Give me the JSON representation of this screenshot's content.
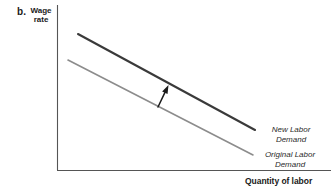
{
  "figure": {
    "panel_letter": "b.",
    "background_color": "#ffffff"
  },
  "axes": {
    "y_axis_title_line1": "Wage",
    "y_axis_title_line2": "rate",
    "x_axis_title": "Quantity of labor",
    "axis_color": "#555555"
  },
  "chart_data": {
    "type": "line",
    "title": "",
    "subtitle": "",
    "xlabel": "Quantity of labor",
    "ylabel": "Wage rate",
    "xlim": [
      0,
      100
    ],
    "ylim": [
      0,
      100
    ],
    "grid": false,
    "legend_position": "inline-right-of-curve",
    "axis_ticks": [],
    "tick_labels": [],
    "series": [
      {
        "name": "New Labor Demand",
        "label_line1": "New Labor",
        "label_line2": "Demand",
        "color": "#3a3a3a",
        "width": 2.1,
        "style": "solid",
        "x": [
          7.7,
          72.2
        ],
        "y": [
          82.4,
          24.2
        ],
        "x_pixels": [
          78,
          255
        ],
        "y_pixels": [
          34,
          130
        ]
      },
      {
        "name": "Original Labor Demand",
        "label_line1": "Original Labor",
        "label_line2": "Demand",
        "color": "#8c8c8c",
        "width": 1.6,
        "style": "solid",
        "x": [
          4.0,
          71.5
        ],
        "y": [
          66.7,
          9.1
        ],
        "x_pixels": [
          68,
          253
        ],
        "y_pixels": [
          60,
          155
        ]
      }
    ],
    "annotations": [
      {
        "name": "shift-arrow",
        "type": "arrow",
        "description": "arrow pointing up-right from original demand curve toward new labor demand curve",
        "from_pixels": [
          158,
          107
        ],
        "to_pixels": [
          168.5,
          85
        ],
        "color": "#1a1a1a"
      }
    ]
  }
}
